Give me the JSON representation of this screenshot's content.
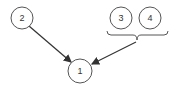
{
  "diagram": {
    "nodes": [
      {
        "id": "1",
        "label": "1"
      },
      {
        "id": "2",
        "label": "2"
      },
      {
        "id": "3",
        "label": "3"
      },
      {
        "id": "4",
        "label": "4"
      }
    ],
    "groups": [
      {
        "id": "group-3-4",
        "members": [
          "3",
          "4"
        ]
      }
    ],
    "edges": [
      {
        "from": "2",
        "to": "1"
      },
      {
        "from": "group-3-4",
        "to": "1"
      }
    ],
    "colors": {
      "stroke": "#555555",
      "arrow": "#333333",
      "background": "#ffffff"
    }
  }
}
